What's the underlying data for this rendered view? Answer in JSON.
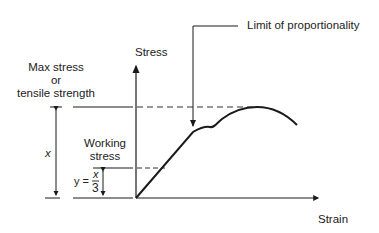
{
  "diagram": {
    "y_axis_label": "Stress",
    "x_axis_label": "Strain",
    "annotation_limit": "Limit of proportionality",
    "max_stress_label": [
      "Max stress",
      "or",
      "tensile strength"
    ],
    "working_stress_label": [
      "Working",
      "stress"
    ],
    "dimension_x": "x",
    "formula": {
      "lhs": "y =",
      "numerator": "x",
      "denominator": "3"
    },
    "colors": {
      "line": "#1a1a1a",
      "background": "#ffffff"
    }
  }
}
